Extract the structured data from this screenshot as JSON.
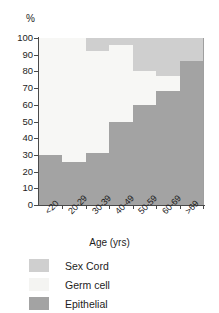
{
  "chart_data": {
    "type": "bar",
    "subtype": "stacked-bar-100-percent",
    "title": "",
    "xlabel": "Age (yrs)",
    "ylabel": "%",
    "y_unit": "%",
    "ylim": [
      0,
      100
    ],
    "yticks": [
      0,
      10,
      20,
      30,
      40,
      50,
      60,
      70,
      80,
      90,
      100
    ],
    "ytick_labels": [
      "0",
      "10",
      "20",
      "30",
      "40",
      "50",
      "60",
      "70",
      "80",
      "90",
      "100"
    ],
    "grid": false,
    "legend_position": "below-axes-left",
    "categories": [
      "<20",
      "20-29",
      "30-39",
      "40-49",
      "50-59",
      "60-69",
      ">69"
    ],
    "series": [
      {
        "name": "Sex Cord",
        "color": "#cfcfcf",
        "values": [
          0,
          0,
          8,
          4,
          20,
          23,
          14
        ]
      },
      {
        "name": "Germ cell",
        "color": "#f7f7f5",
        "values": [
          70,
          74,
          61,
          46,
          20,
          9,
          0
        ]
      },
      {
        "name": "Epithelial",
        "color": "#a3a3a3",
        "values": [
          30,
          26,
          31,
          50,
          60,
          68,
          86
        ]
      }
    ],
    "stack_order_bottom_to_top": [
      "Epithelial",
      "Germ cell",
      "Sex Cord"
    ],
    "cumulative_tops": {
      "epithelial": [
        30,
        26,
        31,
        50,
        60,
        68,
        86
      ],
      "germ_cell": [
        100,
        100,
        92,
        96,
        80,
        77,
        86
      ],
      "sex_cord": [
        100,
        100,
        100,
        100,
        100,
        100,
        100
      ]
    }
  },
  "legend": {
    "items": [
      {
        "label": "Sex Cord",
        "key": "sexcord"
      },
      {
        "label": "Germ cell",
        "key": "germ"
      },
      {
        "label": "Epithelial",
        "key": "epi"
      }
    ]
  }
}
